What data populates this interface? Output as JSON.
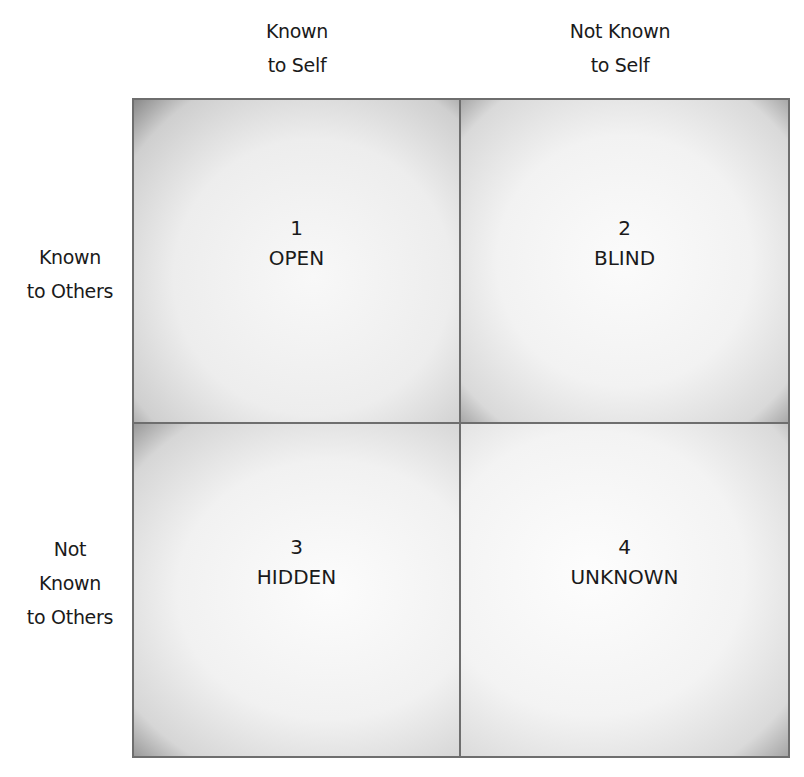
{
  "diagram": {
    "type": "Johari window",
    "columns": [
      {
        "line1": "Known",
        "line2": "to Self"
      },
      {
        "line1": "Not Known",
        "line2": "to Self"
      }
    ],
    "rows": [
      {
        "lines": [
          "Known",
          "to Others"
        ]
      },
      {
        "lines": [
          "Not",
          "Known",
          "to Others"
        ]
      }
    ],
    "quadrants": [
      {
        "number": "1",
        "label": "OPEN"
      },
      {
        "number": "2",
        "label": "BLIND"
      },
      {
        "number": "3",
        "label": "HIDDEN"
      },
      {
        "number": "4",
        "label": "UNKNOWN"
      }
    ]
  }
}
